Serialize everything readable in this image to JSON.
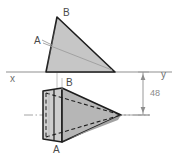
{
  "drawing": {
    "title": "Orthographic projection of a pyramid",
    "background": "#ffffff",
    "fill_light": "#c9c9c9",
    "fill_mid": "#b4b4b4",
    "fill_dark": "#9f9f9f",
    "outline_color": "#1a1a1a",
    "thin_line_color": "#9a9a9a",
    "center_line_color": "#8f8f8f",
    "ground_line_color": "#8a8a8a"
  },
  "labels": {
    "axis_x": "x",
    "axis_y": "y",
    "top_vertex_b": "B",
    "top_vertex_a": "A",
    "bottom_vertex_b": "B",
    "bottom_vertex_a": "A",
    "dimension_48": "48"
  },
  "views": {
    "elevation": {
      "name": "front-view-triangle",
      "points": "46,72 57,17 115,72",
      "apex_b": {
        "x": 57,
        "y": 17
      },
      "point_a": {
        "x": 48,
        "y": 42
      },
      "base_left": {
        "x": 46,
        "y": 72
      },
      "base_right": {
        "x": 115,
        "y": 72
      }
    },
    "plan": {
      "name": "top-view-pyramid",
      "apex_right": {
        "x": 121,
        "y": 115
      },
      "face_top": "62,88 121,115 62,142",
      "box_left": "43,91 62,88 62,142 43,139",
      "point_b": {
        "x": 62,
        "y": 88
      },
      "point_a": {
        "x": 62,
        "y": 142
      }
    }
  },
  "ground_line": {
    "y": 72,
    "x1": 6,
    "x2": 172
  },
  "center_line": {
    "y": 115,
    "x1": 24,
    "x2": 150
  },
  "dimension": {
    "x": 143,
    "y_top": 72,
    "y_bottom": 115,
    "value": "48"
  }
}
